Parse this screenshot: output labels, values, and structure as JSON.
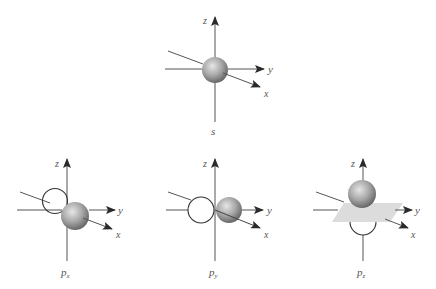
{
  "figure": {
    "axis_labels": {
      "x": "x",
      "y": "y",
      "z": "z"
    },
    "colors": {
      "axis": "#555555",
      "arrowhead": "#2a2a2a",
      "sphere_light": "#d8d8d8",
      "sphere_dark": "#6e6e6e",
      "open_lobe_stroke": "#333333",
      "plane": "#dcdcdc"
    },
    "orbitals": [
      {
        "id": "s",
        "label_main": "s",
        "label_sub": ""
      },
      {
        "id": "px",
        "label_main": "p",
        "label_sub": "x"
      },
      {
        "id": "py",
        "label_main": "p",
        "label_sub": "y"
      },
      {
        "id": "pz",
        "label_main": "p",
        "label_sub": "z"
      }
    ]
  }
}
